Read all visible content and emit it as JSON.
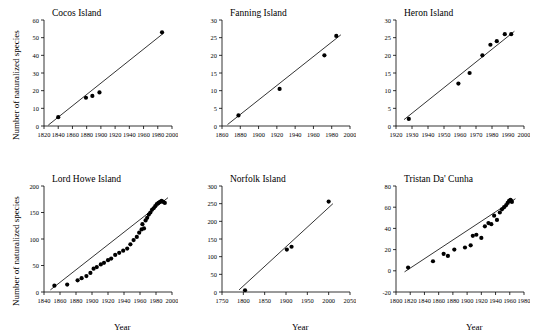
{
  "figure": {
    "axis_labels": {
      "y": "Number of naturalized species",
      "x": "Year"
    }
  },
  "chart_data": [
    {
      "type": "scatter",
      "title": "Cocos Island",
      "xlabel": "",
      "ylabel": "Number of naturalized species",
      "xlim": [
        1820,
        2000
      ],
      "ylim": [
        0,
        60
      ],
      "xticks": [
        1820,
        1840,
        1860,
        1880,
        1900,
        1920,
        1940,
        1960,
        1980,
        2000
      ],
      "yticks": [
        0,
        10,
        20,
        30,
        40,
        50,
        60
      ],
      "grid": false,
      "legend": "none",
      "points": [
        {
          "x": 1840,
          "y": 5
        },
        {
          "x": 1879,
          "y": 16
        },
        {
          "x": 1888,
          "y": 17
        },
        {
          "x": 1898,
          "y": 19
        },
        {
          "x": 1986,
          "y": 53
        }
      ],
      "trend_line": {
        "x": [
          1826,
          1988
        ],
        "y": [
          0.5,
          52.5
        ]
      }
    },
    {
      "type": "scatter",
      "title": "Fanning Island",
      "xlabel": "",
      "ylabel": "",
      "xlim": [
        1860,
        2000
      ],
      "ylim": [
        0,
        30
      ],
      "xticks": [
        1860,
        1880,
        1900,
        1920,
        1940,
        1960,
        1980,
        2000
      ],
      "yticks": [
        0,
        5,
        10,
        15,
        20,
        25,
        30
      ],
      "grid": false,
      "legend": "none",
      "points": [
        {
          "x": 1878,
          "y": 3
        },
        {
          "x": 1923,
          "y": 10.5
        },
        {
          "x": 1972,
          "y": 20
        },
        {
          "x": 1985,
          "y": 25.5
        }
      ],
      "trend_line": {
        "x": [
          1866,
          1990
        ],
        "y": [
          0.4,
          25.8
        ]
      }
    },
    {
      "type": "scatter",
      "title": "Heron Island",
      "xlabel": "",
      "ylabel": "",
      "xlim": [
        1920,
        2000
      ],
      "ylim": [
        0,
        30
      ],
      "xticks": [
        1920,
        1930,
        1940,
        1950,
        1960,
        1970,
        1980,
        1990,
        2000
      ],
      "yticks": [
        0,
        5,
        10,
        15,
        20,
        25,
        30
      ],
      "grid": false,
      "legend": "none",
      "points": [
        {
          "x": 1928,
          "y": 2
        },
        {
          "x": 1959,
          "y": 12
        },
        {
          "x": 1966,
          "y": 15
        },
        {
          "x": 1974,
          "y": 20
        },
        {
          "x": 1979,
          "y": 23
        },
        {
          "x": 1983,
          "y": 24
        },
        {
          "x": 1988,
          "y": 26
        },
        {
          "x": 1992,
          "y": 26
        }
      ],
      "trend_line": {
        "x": [
          1925,
          1994
        ],
        "y": [
          1.8,
          26.8
        ]
      }
    },
    {
      "type": "scatter",
      "title": "Lord Howe Island",
      "xlabel": "Year",
      "ylabel": "Number of naturalized species",
      "xlim": [
        1840,
        2000
      ],
      "ylim": [
        0,
        200
      ],
      "xticks": [
        1840,
        1860,
        1880,
        1900,
        1920,
        1940,
        1960,
        1980,
        2000
      ],
      "yticks": [
        0,
        50,
        100,
        150,
        200
      ],
      "grid": false,
      "legend": "none",
      "points": [
        {
          "x": 1853,
          "y": 12
        },
        {
          "x": 1869,
          "y": 14
        },
        {
          "x": 1882,
          "y": 22
        },
        {
          "x": 1887,
          "y": 26
        },
        {
          "x": 1893,
          "y": 30
        },
        {
          "x": 1898,
          "y": 36
        },
        {
          "x": 1902,
          "y": 44
        },
        {
          "x": 1906,
          "y": 47
        },
        {
          "x": 1911,
          "y": 52
        },
        {
          "x": 1915,
          "y": 55
        },
        {
          "x": 1920,
          "y": 60
        },
        {
          "x": 1924,
          "y": 63
        },
        {
          "x": 1929,
          "y": 70
        },
        {
          "x": 1934,
          "y": 74
        },
        {
          "x": 1939,
          "y": 78
        },
        {
          "x": 1944,
          "y": 82
        },
        {
          "x": 1948,
          "y": 90
        },
        {
          "x": 1952,
          "y": 98
        },
        {
          "x": 1956,
          "y": 104
        },
        {
          "x": 1959,
          "y": 112
        },
        {
          "x": 1962,
          "y": 118
        },
        {
          "x": 1963,
          "y": 128
        },
        {
          "x": 1965,
          "y": 120
        },
        {
          "x": 1967,
          "y": 135
        },
        {
          "x": 1969,
          "y": 140
        },
        {
          "x": 1971,
          "y": 146
        },
        {
          "x": 1973,
          "y": 150
        },
        {
          "x": 1975,
          "y": 155
        },
        {
          "x": 1977,
          "y": 158
        },
        {
          "x": 1979,
          "y": 162
        },
        {
          "x": 1981,
          "y": 166
        },
        {
          "x": 1983,
          "y": 168
        },
        {
          "x": 1985,
          "y": 170
        },
        {
          "x": 1987,
          "y": 172
        },
        {
          "x": 1989,
          "y": 170
        },
        {
          "x": 1991,
          "y": 168
        }
      ],
      "trend_line": {
        "x": [
          1848,
          1995
        ],
        "y": [
          4,
          178
        ]
      }
    },
    {
      "type": "scatter",
      "title": "Norfolk Island",
      "xlabel": "Year",
      "ylabel": "",
      "xlim": [
        1750,
        2050
      ],
      "ylim": [
        0,
        300
      ],
      "xticks": [
        1750,
        1800,
        1850,
        1900,
        1950,
        2000,
        2050
      ],
      "yticks": [
        0,
        50,
        100,
        150,
        200,
        250,
        300
      ],
      "grid": false,
      "legend": "none",
      "points": [
        {
          "x": 1804,
          "y": 5
        },
        {
          "x": 1902,
          "y": 120
        },
        {
          "x": 1913,
          "y": 128
        },
        {
          "x": 2000,
          "y": 256
        }
      ],
      "trend_line": {
        "x": [
          1790,
          2010
        ],
        "y": [
          6,
          250
        ]
      }
    },
    {
      "type": "scatter",
      "title": "Tristan Da' Cunha",
      "xlabel": "Year",
      "ylabel": "",
      "xlim": [
        1800,
        1980
      ],
      "ylim": [
        -20,
        80
      ],
      "xticks": [
        1800,
        1820,
        1840,
        1860,
        1880,
        1900,
        1920,
        1940,
        1960,
        1980
      ],
      "yticks": [
        -20,
        0,
        20,
        40,
        60,
        80
      ],
      "grid": false,
      "legend": "none",
      "points": [
        {
          "x": 1817,
          "y": 3
        },
        {
          "x": 1852,
          "y": 9
        },
        {
          "x": 1867,
          "y": 16
        },
        {
          "x": 1873,
          "y": 14
        },
        {
          "x": 1882,
          "y": 20
        },
        {
          "x": 1897,
          "y": 22
        },
        {
          "x": 1905,
          "y": 24
        },
        {
          "x": 1908,
          "y": 33
        },
        {
          "x": 1913,
          "y": 34
        },
        {
          "x": 1920,
          "y": 31
        },
        {
          "x": 1925,
          "y": 42
        },
        {
          "x": 1930,
          "y": 45
        },
        {
          "x": 1934,
          "y": 44
        },
        {
          "x": 1938,
          "y": 52
        },
        {
          "x": 1942,
          "y": 48
        },
        {
          "x": 1946,
          "y": 55
        },
        {
          "x": 1949,
          "y": 58
        },
        {
          "x": 1952,
          "y": 60
        },
        {
          "x": 1955,
          "y": 62
        },
        {
          "x": 1957,
          "y": 64
        },
        {
          "x": 1959,
          "y": 66
        },
        {
          "x": 1961,
          "y": 67
        },
        {
          "x": 1962,
          "y": 66
        },
        {
          "x": 1963,
          "y": 65
        }
      ],
      "trend_line": {
        "x": [
          1812,
          1968
        ],
        "y": [
          -1,
          68
        ]
      }
    }
  ]
}
